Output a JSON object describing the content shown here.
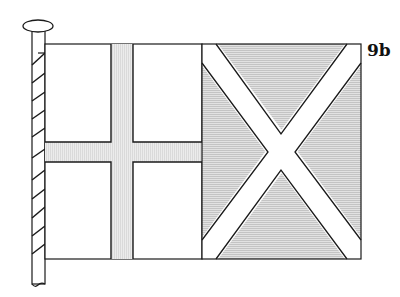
{
  "figure": {
    "label": "9b",
    "colors": {
      "outline": "#1a1a1a",
      "white": "#ffffff",
      "gray_fill": "#d9d9d9",
      "cross_fill": "#e6e6e6"
    }
  }
}
